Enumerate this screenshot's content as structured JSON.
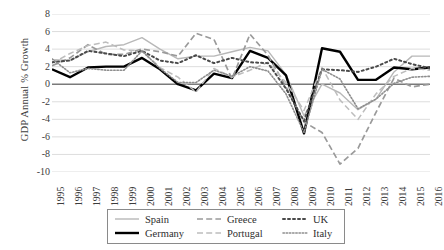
{
  "chart_data": {
    "type": "line",
    "title": "",
    "subtitle": "",
    "xlabel": "",
    "ylabel": "GDP Annual % Growth",
    "ylim": [
      -10,
      8
    ],
    "ytick_labels": [
      "8",
      "6",
      "4",
      "2",
      "0",
      "-2",
      "-4",
      "-6",
      "-8",
      "-10"
    ],
    "ytick_values": [
      8,
      6,
      4,
      2,
      0,
      -2,
      -4,
      -6,
      -8,
      -10
    ],
    "grid": true,
    "grid_axis": "y",
    "legend_position": "bottom",
    "zero_line": true,
    "categories": [
      "1995",
      "1996",
      "1997",
      "1998",
      "1999",
      "2000",
      "2001",
      "2002",
      "2003",
      "2004",
      "2005",
      "2006",
      "2007",
      "2008",
      "2009",
      "2010",
      "2011",
      "2012",
      "2013",
      "2014",
      "2015",
      "2016"
    ],
    "x": [
      1995,
      1996,
      1997,
      1998,
      1999,
      2000,
      2001,
      2002,
      2003,
      2004,
      2005,
      2006,
      2007,
      2008,
      2009,
      2010,
      2011,
      2012,
      2013,
      2014,
      2015,
      2016
    ],
    "series": [
      {
        "name": "Spain",
        "color": "#b8b8b8",
        "style": "solid",
        "width": 1.4,
        "values": [
          2.8,
          2.7,
          3.7,
          4.3,
          4.5,
          5.3,
          4.0,
          2.9,
          3.2,
          3.2,
          3.7,
          4.2,
          3.8,
          1.1,
          -3.6,
          0.0,
          -1.0,
          -2.9,
          -1.7,
          1.4,
          3.2,
          3.2
        ]
      },
      {
        "name": "Germany",
        "color": "#000000",
        "style": "solid",
        "width": 2.4,
        "values": [
          1.7,
          0.8,
          1.9,
          2.0,
          2.0,
          3.0,
          1.7,
          0.0,
          -0.7,
          1.2,
          0.7,
          3.8,
          3.0,
          1.0,
          -5.6,
          4.1,
          3.7,
          0.5,
          0.5,
          1.9,
          1.7,
          1.9
        ]
      },
      {
        "name": "Greece",
        "color": "#9a9a9a",
        "style": "dashed",
        "width": 1.7,
        "values": [
          2.1,
          3.0,
          4.5,
          3.4,
          3.4,
          4.0,
          3.7,
          3.2,
          5.8,
          5.1,
          0.6,
          5.7,
          3.3,
          -0.3,
          -4.3,
          -5.5,
          -9.1,
          -7.3,
          -3.2,
          0.7,
          -0.3,
          0.0
        ]
      },
      {
        "name": "Portugal",
        "color": "#bdbdbd",
        "style": "dashed",
        "width": 1.5,
        "values": [
          2.4,
          3.5,
          4.4,
          4.8,
          3.9,
          3.8,
          1.9,
          0.8,
          -0.9,
          1.8,
          0.8,
          1.6,
          2.5,
          0.2,
          -3.0,
          1.9,
          -1.8,
          -4.0,
          -1.1,
          0.9,
          1.8,
          1.6
        ]
      },
      {
        "name": "UK",
        "color": "#4a4a4a",
        "style": "dotted-thick",
        "width": 2.0,
        "values": [
          2.5,
          2.7,
          3.8,
          3.5,
          3.2,
          3.8,
          2.7,
          2.4,
          3.3,
          2.4,
          3.0,
          2.5,
          2.4,
          -0.5,
          -4.2,
          1.7,
          1.6,
          1.4,
          2.0,
          2.9,
          2.3,
          1.8
        ]
      },
      {
        "name": "Italy",
        "color": "#8e8e8e",
        "style": "dotted-fine",
        "width": 1.6,
        "values": [
          2.9,
          1.3,
          1.8,
          1.6,
          1.6,
          3.8,
          1.8,
          0.2,
          0.2,
          1.6,
          0.9,
          2.0,
          1.5,
          -1.1,
          -5.5,
          1.7,
          0.6,
          -2.8,
          -1.7,
          0.1,
          0.8,
          0.9
        ]
      }
    ]
  },
  "axis": {
    "y_title": "GDP Annual % Growth"
  },
  "legend": {
    "rows": [
      [
        {
          "label": "Spain",
          "color": "#b8b8b8",
          "style": "solid",
          "width": 1.4
        },
        {
          "label": "Greece",
          "color": "#9a9a9a",
          "style": "dashed",
          "width": 1.7
        },
        {
          "label": "UK",
          "color": "#4a4a4a",
          "style": "dotted-thick",
          "width": 2.0
        }
      ],
      [
        {
          "label": "Germany",
          "color": "#000000",
          "style": "solid",
          "width": 2.4
        },
        {
          "label": "Portugal",
          "color": "#bdbdbd",
          "style": "dashed",
          "width": 1.5
        },
        {
          "label": "Italy",
          "color": "#8e8e8e",
          "style": "dotted-fine",
          "width": 1.6
        }
      ]
    ]
  },
  "colors": {
    "gridline": "#d9d9d9",
    "zero_line": "#7a7a7a",
    "text": "#3d3d3d",
    "legend_border": "#8a8a8a",
    "background": "#ffffff"
  }
}
